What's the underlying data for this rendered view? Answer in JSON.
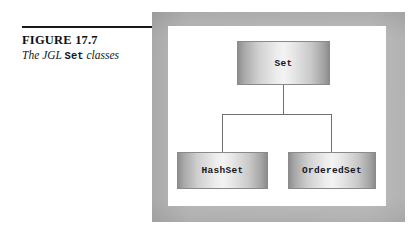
{
  "caption": {
    "figure_number": "FIGURE 17.7",
    "title_prefix": "The JGL ",
    "title_code": "Set",
    "title_suffix": " classes"
  },
  "diagram": {
    "type": "class-hierarchy",
    "root": {
      "id": "set",
      "label": "Set"
    },
    "children": [
      {
        "id": "hashset",
        "label": "HashSet"
      },
      {
        "id": "orderedset",
        "label": "OrderedSet"
      }
    ],
    "colors": {
      "box_border": "#8a8a8a",
      "box_gradient_edge": "#8e8e8e",
      "box_gradient_center": "#f3f3f3",
      "connector_line": "#6f6f6f",
      "backdrop": "#e2e2e2",
      "canvas": "#ffffff",
      "rule": "#16181c"
    }
  }
}
